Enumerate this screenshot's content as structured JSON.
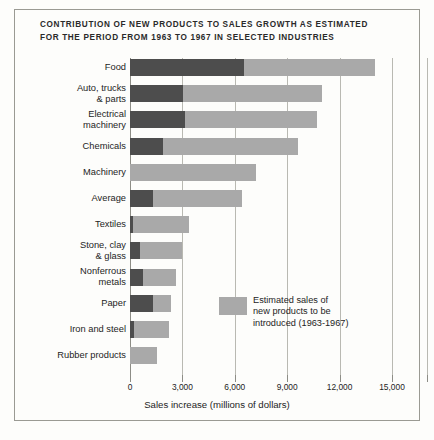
{
  "title": {
    "line1": "CONTRIBUTION OF NEW PRODUCTS TO SALES GROWTH AS ESTIMATED",
    "line2": "FOR THE PERIOD FROM 1963 TO 1967 IN SELECTED INDUSTRIES"
  },
  "legend": {
    "swatch_color": "#a9a9a9",
    "line1": "Estimated sales of",
    "line2": "new products to be",
    "line3": "introduced (1963-1967)"
  },
  "colors": {
    "existing_sales": "#4d4d4d",
    "new_products": "#a9a9a9",
    "gridline": "#b9b9b2",
    "frame": "#9a9a93",
    "text": "#242424",
    "background": "#fdfdfb"
  },
  "chart_data": {
    "type": "bar",
    "orientation": "horizontal",
    "stacked": true,
    "title": "CONTRIBUTION OF NEW PRODUCTS TO SALES GROWTH AS ESTIMATED FOR THE PERIOD FROM 1963 TO 1967 IN SELECTED INDUSTRIES",
    "xlabel": "Sales increase (millions of dollars)",
    "ylabel": "",
    "xlim": [
      0,
      15000
    ],
    "xticks": [
      0,
      3000,
      6000,
      9000,
      12000,
      15000
    ],
    "xticklabels": [
      "0",
      "3,000",
      "6,000",
      "9,000",
      "12,000",
      "15,000"
    ],
    "grid": "vertical",
    "legend_position": "inside-center-right",
    "categories": [
      "Food",
      "Auto, trucks\n& parts",
      "Electrical\nmachinery",
      "Chemicals",
      "Machinery",
      "Average",
      "Textiles",
      "Stone, clay\n& glass",
      "Nonferrous\nmetals",
      "Paper",
      "Iron and steel",
      "Rubber products"
    ],
    "series": [
      {
        "name": "Sales increase from existing products",
        "color": "#4d4d4d",
        "values": [
          6500,
          3050,
          3150,
          1900,
          0,
          1300,
          150,
          570,
          750,
          1300,
          230,
          0
        ]
      },
      {
        "name": "Estimated sales of new products to be introduced (1963-1967)",
        "color": "#a9a9a9",
        "values": [
          7500,
          7950,
          7550,
          7700,
          7200,
          5100,
          3250,
          2430,
          1900,
          1050,
          2020,
          1550
        ]
      }
    ],
    "totals": [
      14000,
      11000,
      10700,
      9600,
      7200,
      6400,
      3400,
      3000,
      2650,
      2350,
      2250,
      1550
    ]
  }
}
